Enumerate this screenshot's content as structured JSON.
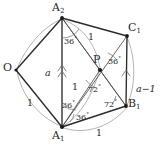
{
  "figure": {
    "kind": "geometry-diagram",
    "stroke_color": "#2b2b2b",
    "arc_color": "#9a9a9a",
    "background": "#ffffff"
  },
  "vertices": [
    {
      "id": "A2",
      "label": "A",
      "sub": "2",
      "x": 62,
      "y": 18,
      "label_x": 52,
      "label_y": 2,
      "dot": true
    },
    {
      "id": "C1",
      "label": "C",
      "sub": "1",
      "x": 127,
      "y": 36,
      "label_x": 128,
      "label_y": 22,
      "dot": true
    },
    {
      "id": "P",
      "label": "P",
      "sub": "",
      "x": 100,
      "y": 70,
      "label_x": 93,
      "label_y": 54,
      "dot": true
    },
    {
      "id": "B1",
      "label": "B",
      "sub": "1",
      "x": 126,
      "y": 106,
      "label_x": 128,
      "label_y": 98,
      "dot": true
    },
    {
      "id": "A1",
      "label": "A",
      "sub": "1",
      "x": 62,
      "y": 127,
      "label_x": 52,
      "label_y": 130,
      "dot": true
    },
    {
      "id": "O",
      "label": "O",
      "sub": "",
      "x": 16,
      "y": 70,
      "label_x": 3,
      "label_y": 62,
      "dot": true
    }
  ],
  "edges": [
    {
      "from": "A2",
      "to": "C1",
      "weight": "thick"
    },
    {
      "from": "C1",
      "to": "B1",
      "weight": "thick"
    },
    {
      "from": "B1",
      "to": "A1",
      "weight": "thick"
    },
    {
      "from": "A1",
      "to": "O",
      "weight": "thick"
    },
    {
      "from": "O",
      "to": "A2",
      "weight": "thick"
    },
    {
      "from": "A2",
      "to": "A1",
      "weight": "thick"
    },
    {
      "from": "A2",
      "to": "P",
      "weight": "thin"
    },
    {
      "from": "A1",
      "to": "P",
      "weight": "thin"
    },
    {
      "from": "A1",
      "to": "C1",
      "weight": "thin"
    },
    {
      "from": "A2",
      "to": "B1",
      "weight": "thin"
    },
    {
      "from": "P",
      "to": "B1",
      "weight": "thin"
    }
  ],
  "length_labels": [
    {
      "id": "len-a2c1",
      "text": "1",
      "x": 88,
      "y": 32
    },
    {
      "id": "len-oa1",
      "text": "1",
      "x": 27,
      "y": 98
    },
    {
      "id": "len-a1b1",
      "text": "1",
      "x": 96,
      "y": 128
    },
    {
      "id": "len-a1p",
      "text": "1",
      "x": 72,
      "y": 82
    },
    {
      "id": "len-oa2",
      "text": "a",
      "x": 45,
      "y": 68,
      "italic": true
    },
    {
      "id": "len-c1b1",
      "text": "a−1",
      "x": 136,
      "y": 84,
      "italic": true
    }
  ],
  "angle_labels": [
    {
      "id": "ang-a2-apex",
      "text": "36",
      "deg": "°",
      "x": 64,
      "y": 36
    },
    {
      "id": "ang-p-right",
      "text": "36",
      "deg": "°",
      "x": 108,
      "y": 56
    },
    {
      "id": "ang-p-lower",
      "text": "72",
      "deg": "°",
      "x": 88,
      "y": 84
    },
    {
      "id": "ang-b1-upper",
      "text": "72",
      "deg": "°",
      "x": 104,
      "y": 99
    },
    {
      "id": "ang-a1-upper",
      "text": "36",
      "deg": "°",
      "x": 62,
      "y": 100
    },
    {
      "id": "ang-a1-lower",
      "text": "36",
      "deg": "°",
      "x": 76,
      "y": 112
    }
  ],
  "tick_marks": [
    {
      "id": "tick-oa2-double",
      "note": "double chevron on segment O-A2 near a"
    },
    {
      "id": "tick-c1b1-single",
      "note": "single chevron on segment C1-B1 near a-1"
    }
  ],
  "arcs": [
    {
      "id": "arc-a2-to-o",
      "note": "light circular arc from A2 sweeping left to O"
    },
    {
      "id": "arc-o-to-a1",
      "note": "light circular arc from O sweeping down to A1"
    },
    {
      "id": "arc-a1-to-b1",
      "note": "light circular arc along bottom from A1 to B1"
    },
    {
      "id": "arc-a2-to-p",
      "note": "light arc from A2 curving to P"
    },
    {
      "id": "arc-p-to-a1",
      "note": "light arc from P curving to A1"
    },
    {
      "id": "arc-c1-to-b1",
      "note": "light arc from C1 down to B1"
    }
  ]
}
